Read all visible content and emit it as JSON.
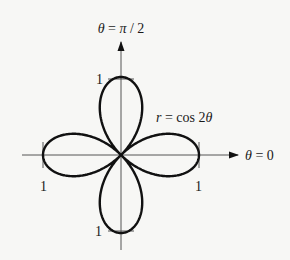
{
  "figure": {
    "equation": "r = cos 2θ",
    "equation_parts": {
      "lhs": "r",
      "eq": " = cos 2",
      "theta": "θ"
    },
    "axis_labels": {
      "vertical": "θ = π / 2",
      "horizontal": "θ = 0"
    },
    "tick_labels": {
      "top": "1",
      "bottom": "1",
      "left": "1",
      "right": "1"
    },
    "curve": {
      "type": "rose",
      "function": "cos(2*theta)",
      "petals": 4,
      "max_r": 1
    },
    "colors": {
      "stroke": "#111111",
      "axis": "#555555",
      "background": "#f7f7f5"
    }
  }
}
